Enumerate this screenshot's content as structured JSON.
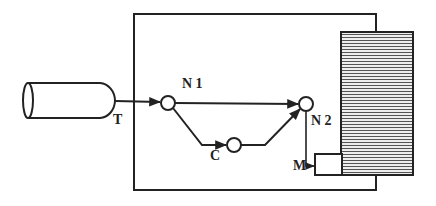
{
  "diagram": {
    "labels": {
      "tank": "T",
      "node1": "N 1",
      "node2": "N 2",
      "component_c": "C",
      "component_m": "M"
    },
    "colors": {
      "stroke": "#222222",
      "hatch": "#555555",
      "background": "#ffffff"
    }
  }
}
